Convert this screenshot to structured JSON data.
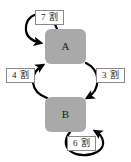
{
  "diagram": {
    "type": "state-transition-diagram",
    "background_color": "#ffffff",
    "node_fill_color": "#a9a9a9",
    "arrow_color": "#000000",
    "label_border_color": "#8a8a8a",
    "nodes": [
      {
        "id": "A",
        "label": "A"
      },
      {
        "id": "B",
        "label": "B"
      }
    ],
    "edges": [
      {
        "id": "a-self",
        "from": "A",
        "to": "A",
        "label": "7 割",
        "position": "top"
      },
      {
        "id": "b-to-a",
        "from": "B",
        "to": "A",
        "label": "4 割",
        "position": "left"
      },
      {
        "id": "a-to-b",
        "from": "A",
        "to": "B",
        "label": "3 割",
        "position": "right"
      },
      {
        "id": "b-self",
        "from": "B",
        "to": "B",
        "label": "6 割",
        "position": "bottom"
      }
    ]
  }
}
